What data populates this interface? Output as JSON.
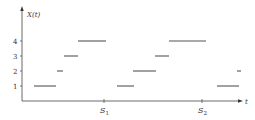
{
  "chart_data": {
    "type": "line",
    "subtype": "step-function",
    "title": "",
    "xlabel": "t",
    "ylabel": "X(t)",
    "y_ticks": [
      1,
      2,
      3,
      4
    ],
    "x_ticks": [
      "S1",
      "S2"
    ],
    "ylim": [
      0,
      5
    ],
    "grid": false,
    "legend": null,
    "segments": [
      {
        "y": 1,
        "x_start": 34,
        "x_end": 56
      },
      {
        "y": 2,
        "x_start": 57,
        "x_end": 63
      },
      {
        "y": 3,
        "x_start": 64,
        "x_end": 78
      },
      {
        "y": 4,
        "x_start": 78,
        "x_end": 106
      },
      {
        "y": 1,
        "x_start": 117,
        "x_end": 134
      },
      {
        "y": 2,
        "x_start": 133,
        "x_end": 156
      },
      {
        "y": 3,
        "x_start": 155,
        "x_end": 169
      },
      {
        "y": 4,
        "x_start": 169,
        "x_end": 206
      },
      {
        "y": 1,
        "x_start": 217,
        "x_end": 239
      },
      {
        "y": 2,
        "x_start": 237,
        "x_end": 241
      }
    ]
  },
  "labels": {
    "y_axis": "X(t)",
    "x_axis": "t",
    "tick_1": "1",
    "tick_2": "2",
    "tick_3": "3",
    "tick_4": "4",
    "s1_base": "S",
    "s1_sub": "1",
    "s2_base": "S",
    "s2_sub": "2"
  }
}
